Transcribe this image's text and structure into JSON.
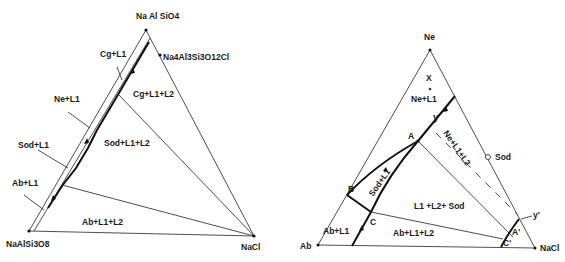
{
  "left_diagram": {
    "vertices": {
      "top": "Na Al SiO4",
      "bottom_left": "NaAlSi3O8",
      "bottom_right": "NaCl",
      "side_point": "Na4Al3Si3O12Cl"
    },
    "fields": {
      "cg_l1": "Cg+L1",
      "ne_l1": "Ne+L1",
      "sod_l1": "Sod+L1",
      "ab_l1": "Ab+L1",
      "cg_l1_l2": "Cg+L1+L2",
      "sod_l1_l2": "Sod+L1+L2",
      "ab_l1_l2": "Ab+L1+L2"
    }
  },
  "right_diagram": {
    "vertices": {
      "top": "Ne",
      "bottom_left": "Ab",
      "bottom_right": "NaCl",
      "sod_point": "Sod"
    },
    "points": {
      "x": "X",
      "y": "y",
      "a": "A",
      "b": "B",
      "c": "C",
      "a_prime": "A'",
      "c_prime": "C'",
      "y_prime": "y'"
    },
    "fields": {
      "ne_l1": "Ne+L1",
      "ne_l1_l2": "Ne+L1+L2",
      "sod_l1": "Sod+L1",
      "l1_l2_sod": "L1 +L2+ Sod",
      "ab_l1": "Ab+L1",
      "ab_l1_l2": "Ab+L1+L2"
    }
  }
}
